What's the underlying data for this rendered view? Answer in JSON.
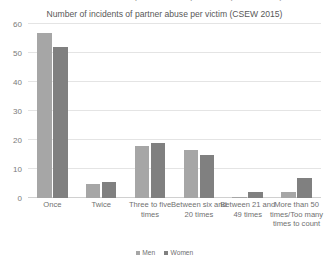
{
  "clipped_title_above": "Number of incidents of partner abuse per victim  (CSEW 2015)",
  "chart_data": {
    "type": "bar",
    "title": "Number of incidents of partner abuse per victim  (CSEW 2015)",
    "xlabel": "",
    "ylabel": "",
    "ylim": [
      0,
      60
    ],
    "yticks": [
      0,
      10,
      20,
      30,
      40,
      50,
      60
    ],
    "ytick_labels": [
      "0",
      "10",
      "20",
      "30",
      "40",
      "50",
      "60"
    ],
    "grid": true,
    "legend_position": "bottom-center",
    "categories": [
      "Once",
      "Twice",
      "Three to five times",
      "Between six and 20 times",
      "Between 21 and 49 times",
      "More than 50 times/Too many times to count"
    ],
    "series": [
      {
        "name": "Men",
        "color": "#a6a6a6",
        "values": [
          57,
          5,
          18,
          16.5,
          0.5,
          2
        ]
      },
      {
        "name": "Women",
        "color": "#808080",
        "values": [
          52,
          5.5,
          19,
          15,
          2,
          7
        ]
      }
    ]
  }
}
